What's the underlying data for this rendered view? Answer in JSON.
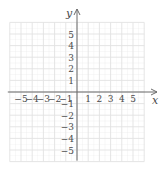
{
  "chart_data": {
    "type": "scatter",
    "title": "",
    "xlabel": "x",
    "ylabel": "y",
    "xlim": [
      -6,
      6
    ],
    "ylim": [
      -6,
      6
    ],
    "grid": true,
    "x_ticks": [
      -5,
      -4,
      -3,
      -2,
      -1,
      1,
      2,
      3,
      4,
      5
    ],
    "y_ticks": [
      5,
      4,
      3,
      2,
      1,
      -1,
      -2,
      -3,
      -4,
      -5
    ],
    "x_tick_labels": [
      "−5",
      "−4",
      "−3",
      "−2",
      "−1",
      "1",
      "2",
      "3",
      "4",
      "5"
    ],
    "y_tick_labels": [
      "5",
      "4",
      "3",
      "2",
      "1",
      "−1",
      "−2",
      "−3",
      "−4",
      "−5"
    ],
    "series": [],
    "legend": null
  },
  "colors": {
    "grid": "#e2e2e2",
    "axis": "#6b6b6b",
    "text": "#4a4a4a"
  }
}
